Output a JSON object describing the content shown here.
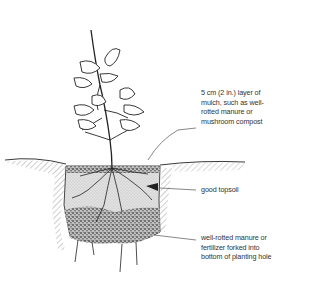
{
  "diagram": {
    "colors": {
      "ink": "#222222",
      "soil_fill": "#d6d6d6",
      "label_text": "#333333",
      "leader_line": "#555555"
    },
    "labels": [
      {
        "id": "mulch",
        "lines": [
          "5 cm (2 in.) layer of",
          "mulch, such as well-",
          "rotted manure or",
          "mushroom compost"
        ]
      },
      {
        "id": "topsoil",
        "lines": [
          "good topsoil"
        ]
      },
      {
        "id": "manure",
        "lines": [
          "well-rotted manure or",
          "fertilizer forked into",
          "bottom of planting hole"
        ]
      }
    ]
  }
}
